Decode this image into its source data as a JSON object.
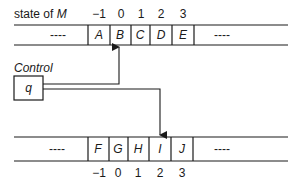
{
  "title": {
    "prefix": "state of ",
    "machine": "M"
  },
  "control_label": "Control",
  "state_symbol": "q",
  "top_tape": {
    "left_ellipsis": "----",
    "right_ellipsis": "----",
    "indices": [
      "−1",
      "0",
      "1",
      "2",
      "3"
    ],
    "cells": [
      "A",
      "B",
      "C",
      "D",
      "E"
    ],
    "head_index": "0"
  },
  "bottom_tape": {
    "left_ellipsis": "----",
    "right_ellipsis": "----",
    "indices": [
      "−1",
      "0",
      "1",
      "2",
      "3"
    ],
    "cells": [
      "F",
      "G",
      "H",
      "I",
      "J"
    ],
    "head_index": "2"
  },
  "colors": {
    "ink": "#1a1a1a",
    "background": "#ffffff"
  }
}
